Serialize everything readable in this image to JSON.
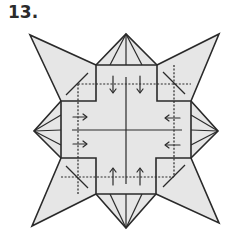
{
  "step": {
    "number_label": "13."
  },
  "diagram": {
    "fill_color": "#e6e6e6",
    "line_color": "#2a2a2a",
    "center": [
      126,
      130
    ],
    "inner_square": {
      "left": 61,
      "top": 65,
      "right": 191,
      "bottom": 194
    },
    "dashed_square": {
      "left": 78,
      "top": 84,
      "right": 174,
      "bottom": 177
    },
    "star_points": [
      {
        "name": "top-left",
        "tip": [
          30,
          35
        ]
      },
      {
        "name": "top-right",
        "tip": [
          219,
          34
        ]
      },
      {
        "name": "bottom-left",
        "tip": [
          32,
          226
        ]
      },
      {
        "name": "bottom-right",
        "tip": [
          219,
          223
        ]
      }
    ],
    "pyramid_flaps": [
      {
        "name": "top",
        "apex": [
          126,
          34
        ]
      },
      {
        "name": "bottom",
        "apex": [
          126,
          228
        ]
      },
      {
        "name": "left",
        "apex": [
          34,
          131
        ]
      },
      {
        "name": "right",
        "apex": [
          218,
          131
        ]
      }
    ],
    "arrows": [
      {
        "side": "top",
        "direction": "down",
        "count": 2
      },
      {
        "side": "bottom",
        "direction": "up",
        "count": 2
      },
      {
        "side": "left",
        "direction": "right",
        "count": 2
      },
      {
        "side": "right",
        "direction": "left",
        "count": 2
      }
    ]
  }
}
